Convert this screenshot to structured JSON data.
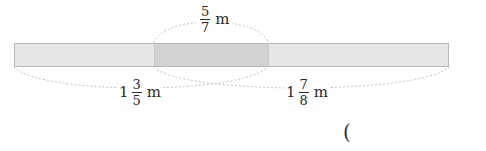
{
  "diagram": {
    "type": "overlapping-tape-diagram",
    "colors": {
      "tape_light": "#e6e6e6",
      "tape_overlap": "#d2d2d2",
      "tape_border": "#b8b8b8",
      "arc": "#c4c4c4",
      "text": "#2a2a2a"
    },
    "tape": {
      "x_start": 14,
      "x_end": 449,
      "y_top": 43,
      "y_bottom": 67,
      "overlap_start": 154,
      "overlap_end": 268
    },
    "labels": {
      "overlap": {
        "whole": "",
        "numerator": "5",
        "denominator": "7",
        "unit": "m"
      },
      "left_piece": {
        "whole": "1",
        "numerator": "3",
        "denominator": "5",
        "unit": "m"
      },
      "right_piece": {
        "whole": "1",
        "numerator": "7",
        "denominator": "8",
        "unit": "m"
      }
    },
    "answer_paren": "("
  }
}
